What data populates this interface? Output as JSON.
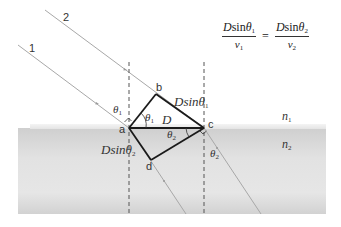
{
  "diagram": {
    "formula": {
      "left_numerator": "D sin θ1",
      "left_denominator": "v1",
      "equals": "=",
      "right_numerator": "D sin θ2",
      "right_denominator": "v2",
      "parts": {
        "D": "D",
        "sin": "sin",
        "theta": "θ",
        "v": "v",
        "sub1": "1",
        "sub2": "2"
      }
    },
    "rays": [
      {
        "label": "1"
      },
      {
        "label": "2"
      }
    ],
    "points": {
      "a": "a",
      "b": "b",
      "c": "c",
      "d": "d"
    },
    "segment_labels": {
      "bc": {
        "main": "Dsinθ",
        "sub": "1"
      },
      "ac": {
        "main": "D"
      },
      "ad": {
        "main": "Dsinθ",
        "sub": "2"
      }
    },
    "angles": {
      "incident_at_a": {
        "main": "θ",
        "sub": "1"
      },
      "bac": {
        "main": "θ",
        "sub": "1"
      },
      "acd": {
        "main": "θ",
        "sub": "2"
      },
      "refracted_at_c": {
        "main": "θ",
        "sub": "2"
      }
    },
    "media": {
      "upper": {
        "main": "n",
        "sub": "1"
      },
      "lower": {
        "main": "n",
        "sub": "2"
      }
    },
    "colors": {
      "medium_fill": "#d9d9d9",
      "medium_edge": "#ececec",
      "ray": "#a8a8a8",
      "wavefront": "#1a1a1a",
      "normal": "#555555",
      "text": "#333333"
    }
  }
}
